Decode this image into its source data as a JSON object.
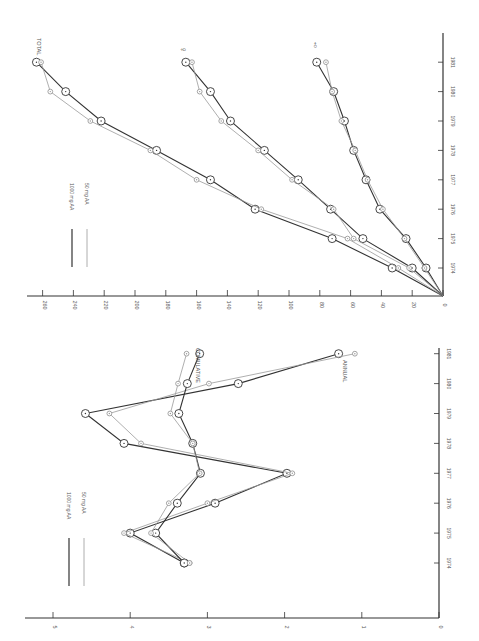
{
  "figure": {
    "legend_1000": "1000 mg AA",
    "legend_50": "50 mg AA",
    "colors": {
      "series_1000": "#333333",
      "series_50": "#9a9a9a",
      "axis": "#333333",
      "label": "#555555"
    }
  },
  "chart_data": [
    {
      "type": "line",
      "title": "",
      "orientation_note": "figure printed rotated 90 degrees counter-clockwise",
      "xlabel": "Year",
      "ylabel": "",
      "ylim": [
        0,
        5
      ],
      "yticks": [
        0,
        1,
        2,
        3,
        4,
        5
      ],
      "categories": [
        "1974",
        "1975",
        "1976",
        "1977",
        "1978",
        "1979",
        "1980",
        "1981"
      ],
      "legend": [
        "1000 mg AA",
        "50 mg AA"
      ],
      "annotations": [
        "CUMULATIVE",
        "ANNUAL"
      ],
      "series": [
        {
          "name": "1000 mg AA – Annual",
          "group": "ANNUAL",
          "dose": "1000",
          "values": [
            3.3,
            4.0,
            2.9,
            1.97,
            4.08,
            4.58,
            2.6,
            1.3
          ]
        },
        {
          "name": "50 mg AA – Annual",
          "group": "ANNUAL",
          "dose": "50",
          "values": [
            3.23,
            4.08,
            3.0,
            1.9,
            3.86,
            4.27,
            2.98,
            1.09
          ]
        },
        {
          "name": "1000 mg AA – Cumulative",
          "group": "CUMULATIVE",
          "dose": "1000",
          "values": [
            3.3,
            3.67,
            3.39,
            3.09,
            3.19,
            3.37,
            3.26,
            3.1
          ]
        },
        {
          "name": "50 mg AA – Cumulative",
          "group": "CUMULATIVE",
          "dose": "50",
          "values": [
            3.23,
            3.73,
            3.5,
            3.1,
            3.19,
            3.48,
            3.38,
            3.27
          ]
        }
      ]
    },
    {
      "type": "line",
      "title": "",
      "orientation_note": "figure printed rotated 90 degrees counter-clockwise",
      "xlabel": "Year",
      "ylabel": "",
      "ylim": [
        0,
        260
      ],
      "yticks": [
        0,
        20,
        40,
        60,
        80,
        100,
        120,
        140,
        160,
        180,
        200,
        220,
        240,
        260
      ],
      "categories": [
        "1974",
        "1975",
        "1976",
        "1977",
        "1978",
        "1979",
        "1980",
        "1981"
      ],
      "legend": [
        "1000 mg AA",
        "50 mg AA"
      ],
      "annotations": [
        "TOTAL",
        "♀",
        "♂"
      ],
      "series": [
        {
          "name": "1000 mg AA – Total",
          "group": "TOTAL",
          "dose": "1000",
          "values": [
            33,
            72,
            122,
            151,
            186,
            222,
            245,
            264
          ]
        },
        {
          "name": "50 mg AA – Total",
          "group": "TOTAL",
          "dose": "50",
          "values": [
            29,
            62,
            118,
            160,
            190,
            229,
            255,
            261
          ]
        },
        {
          "name": "1000 mg AA – Female",
          "group": "♀",
          "dose": "1000",
          "values": [
            20,
            52,
            73,
            94,
            116,
            138,
            151,
            167
          ]
        },
        {
          "name": "50 mg AA – Female",
          "group": "♀",
          "dose": "50",
          "values": [
            22,
            58,
            71,
            98,
            120,
            144,
            158,
            163
          ]
        },
        {
          "name": "1000 mg AA – Male",
          "group": "♂",
          "dose": "1000",
          "values": [
            11,
            24,
            41,
            50,
            58,
            64,
            71,
            82
          ]
        },
        {
          "name": "50 mg AA – Male",
          "group": "♂",
          "dose": "50",
          "values": [
            12,
            25,
            39,
            49,
            57,
            66,
            72,
            76
          ]
        }
      ]
    }
  ]
}
